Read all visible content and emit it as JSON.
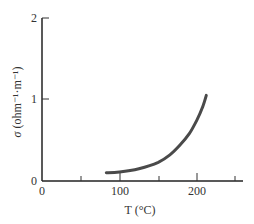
{
  "chart_data": {
    "type": "line",
    "title": "",
    "xlabel": "T (°C)",
    "ylabel": "σ (ohm⁻¹·m⁻¹)",
    "xlim": [
      0,
      260
    ],
    "ylim": [
      0,
      2
    ],
    "x_ticks": [
      0,
      50,
      100,
      150,
      200,
      250
    ],
    "x_tick_labels": [
      "0",
      "",
      "100",
      "",
      "200",
      ""
    ],
    "y_ticks": [
      0,
      1,
      2
    ],
    "y_tick_labels": [
      "0",
      "1",
      "2"
    ],
    "grid": false,
    "legend": null,
    "series": [
      {
        "name": "conductivity",
        "color": "#4a4a4a",
        "x": [
          83,
          100,
          125,
          150,
          165,
          178,
          190,
          200,
          207,
          212
        ],
        "y": [
          0.1,
          0.11,
          0.15,
          0.23,
          0.32,
          0.44,
          0.58,
          0.75,
          0.9,
          1.05
        ]
      }
    ]
  },
  "labels": {
    "x_axis": "T (°C)",
    "y_axis_sigma": "σ",
    "y_axis_units": "(ohm⁻¹·m⁻¹)",
    "x_tick_0": "0",
    "x_tick_100": "100",
    "x_tick_200": "200",
    "y_tick_0": "0",
    "y_tick_1": "1",
    "y_tick_2": "2"
  }
}
